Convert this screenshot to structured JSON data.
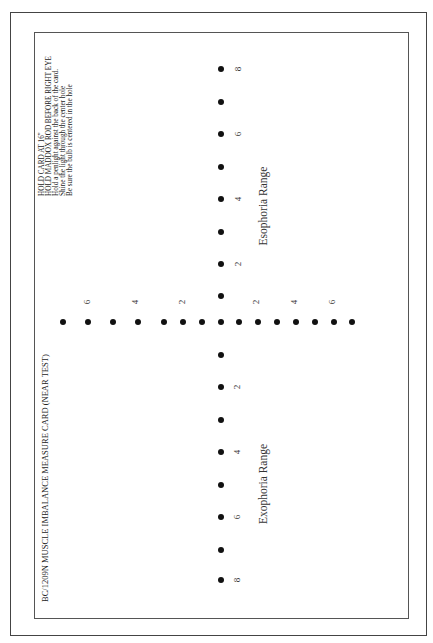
{
  "card": {
    "title": "BC/1209N MUSCLE IMBALANCE MEASURE CARD (NEAR TEST)",
    "instructions": [
      "HOLD CARD AT 16\"",
      "HOLD MADDOX ROD BEFORE RIGHT EYE",
      "Hold a penlight against the back of the card.",
      "Shine the light through the center hole",
      "Be sure the bulb is centered in the hole"
    ],
    "upper_range_label": "Esophoria Range",
    "lower_range_label": "Exophoria Range",
    "vertical_ticks": {
      "upper": [
        "8",
        "6",
        "4",
        "2"
      ],
      "lower": [
        "2",
        "4",
        "6",
        "8"
      ]
    },
    "horizontal_ticks": {
      "left": [
        "6",
        "4",
        "2"
      ],
      "right": [
        "2",
        "4",
        "6"
      ]
    },
    "colors": {
      "dot": "#111111",
      "frame": "#444444",
      "background": "#ffffff"
    }
  }
}
